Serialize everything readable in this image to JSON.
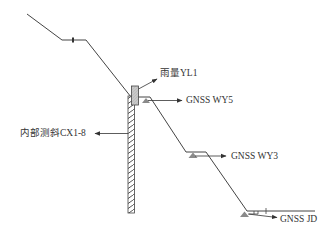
{
  "diagram": {
    "type": "slope-monitoring-cross-section",
    "colors": {
      "line": "#444444",
      "marker_fill": "#8a8a8a",
      "gauge_fill": "#c8c8c8",
      "text": "#333333"
    },
    "labels": {
      "rain_gauge": "雨量YL1",
      "gnss_wy5": "GNSS WY5",
      "inclinometer": "内部测斜CX1-8",
      "gnss_wy3": "GNSS WY3",
      "gnss_jd": "GNSS JD"
    },
    "instruments": [
      {
        "id": "YL1",
        "kind": "rain-gauge",
        "label_key": "rain_gauge"
      },
      {
        "id": "WY5",
        "kind": "gnss-station",
        "label_key": "gnss_wy5"
      },
      {
        "id": "CX1-8",
        "kind": "inclinometer",
        "label_key": "inclinometer"
      },
      {
        "id": "WY3",
        "kind": "gnss-station",
        "label_key": "gnss_wy3"
      },
      {
        "id": "JD",
        "kind": "gnss-reference",
        "label_key": "gnss_jd"
      }
    ]
  }
}
